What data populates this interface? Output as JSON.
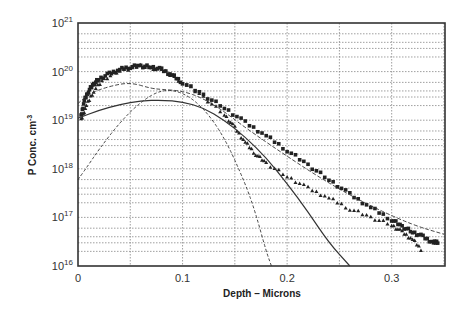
{
  "chart_data": {
    "type": "scatter",
    "title": "",
    "xlabel": "Depth - Microns",
    "ylabel": "P Conc. cm^-3",
    "xlim": [
      0,
      0.351
    ],
    "ylim": [
      1e+16,
      1e+21
    ],
    "yscale": "log",
    "grid": true,
    "legend": null,
    "x_ticks": [
      "0",
      "0.1",
      "0.2",
      "0.3"
    ],
    "y_ticks": [
      "10^16",
      "10^17",
      "10^18",
      "10^19",
      "10^20",
      "10^21"
    ],
    "series": [
      {
        "name": "measured-upper (filled squares)",
        "style": "markers-square",
        "x": [
          0.003,
          0.006,
          0.01,
          0.015,
          0.02,
          0.03,
          0.04,
          0.05,
          0.06,
          0.07,
          0.08,
          0.09,
          0.1,
          0.12,
          0.14,
          0.16,
          0.18,
          0.2,
          0.22,
          0.24,
          0.26,
          0.28,
          0.3,
          0.31,
          0.32,
          0.33,
          0.34,
          0.345
        ],
        "y": [
          1.2e+19,
          2.5e+19,
          4e+19,
          5.5e+19,
          7e+19,
          9e+19,
          1.1e+20,
          1.25e+20,
          1.3e+20,
          1.25e+20,
          1.1e+20,
          8.5e+19,
          6e+19,
          3.3e+19,
          1.8e+19,
          9e+18,
          4.8e+18,
          2.4e+18,
          1.2e+18,
          6e+17,
          3e+17,
          1.6e+17,
          9e+16,
          6.5e+16,
          5e+16,
          4e+16,
          3e+16,
          3.2e+16
        ]
      },
      {
        "name": "measured-lower (triangles)",
        "style": "markers-triangle",
        "x": [
          0.003,
          0.008,
          0.015,
          0.025,
          0.04,
          0.06,
          0.08,
          0.1,
          0.12,
          0.14,
          0.15,
          0.16,
          0.17,
          0.18,
          0.2,
          0.22,
          0.24,
          0.26,
          0.28,
          0.3,
          0.31,
          0.32,
          0.33
        ],
        "y": [
          1e+19,
          2e+19,
          4e+19,
          7e+19,
          1.05e+20,
          1.3e+20,
          1.1e+20,
          6e+19,
          3e+19,
          1.3e+19,
          7e+18,
          3.5e+18,
          2e+18,
          1.3e+18,
          7e+17,
          4e+17,
          2.5e+17,
          1.5e+17,
          1e+17,
          7e+16,
          5e+16,
          3.5e+16,
          2e+16
        ]
      },
      {
        "name": "simulation-1 (solid)",
        "style": "solid",
        "x": [
          0,
          0.02,
          0.04,
          0.06,
          0.08,
          0.1,
          0.12,
          0.14,
          0.16,
          0.18,
          0.2,
          0.22,
          0.24,
          0.26
        ],
        "y": [
          1.1e+19,
          1.6e+19,
          2.1e+19,
          2.5e+19,
          2.6e+19,
          2.4e+19,
          1.8e+19,
          1e+19,
          4.5e+18,
          1.7e+18,
          5e+17,
          1.3e+17,
          3e+16,
          1e+16
        ]
      },
      {
        "name": "simulation-2 (dashed)",
        "style": "dashed",
        "x": [
          0,
          0.01,
          0.03,
          0.05,
          0.07,
          0.08,
          0.1,
          0.12,
          0.14,
          0.16,
          0.2,
          0.24,
          0.28,
          0.32,
          0.35
        ],
        "y": [
          2.2e+19,
          3.5e+19,
          5e+19,
          6e+19,
          4.5e+19,
          4.3e+19,
          4e+19,
          2.8e+19,
          1.5e+19,
          7e+18,
          1.8e+18,
          5e+17,
          1.7e+17,
          7e+16,
          4.5e+16
        ]
      },
      {
        "name": "simulation-3 (fine dashed, implant Gaussian)",
        "style": "dash-dot",
        "x": [
          0,
          0.01,
          0.02,
          0.04,
          0.06,
          0.08,
          0.1,
          0.12,
          0.14,
          0.16,
          0.17,
          0.18,
          0.185
        ],
        "y": [
          6e+17,
          1.2e+18,
          2.5e+18,
          9e+18,
          2.4e+19,
          4.3e+19,
          3.8e+19,
          1.8e+19,
          4.5e+18,
          5e+17,
          1.2e+17,
          2e+16,
          1e+16
        ]
      }
    ]
  },
  "axes": {
    "x_label": "Depth  –  Microns",
    "y_label_main": "P Conc. cm",
    "y_label_sup": "-3",
    "x_tick_labels": [
      "0",
      "0.1",
      "0.2",
      "0.3"
    ],
    "y_tick_base": "10",
    "y_tick_exponents": [
      "21",
      "20",
      "19",
      "18",
      "17",
      "16"
    ]
  }
}
